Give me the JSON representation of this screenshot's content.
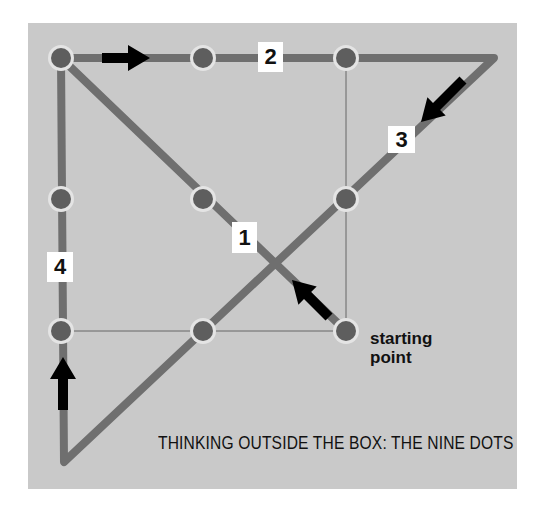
{
  "title": "THINKING OUTSIDE THE BOX: THE NINE DOTS",
  "start_label": [
    "starting",
    "point"
  ],
  "step_labels": [
    {
      "text": "1",
      "x": 232,
      "y": 222,
      "w": 25,
      "h": 31
    },
    {
      "text": "2",
      "x": 258,
      "y": 42,
      "w": 25,
      "h": 30
    },
    {
      "text": "3",
      "x": 388,
      "y": 126,
      "w": 27,
      "h": 27
    },
    {
      "text": "4",
      "x": 47,
      "y": 252,
      "w": 26,
      "h": 30
    }
  ],
  "colors": {
    "background": "#c9c9c9",
    "path_line": "#6f6f6f",
    "dot": "#5e5e5e",
    "dot_halo": "#e4e4e4",
    "box_outline": "#666666",
    "arrow": "#000000"
  },
  "grid": {
    "xs": [
      61,
      203,
      346
    ],
    "ys": [
      58,
      199,
      331
    ]
  },
  "path_points": [
    [
      346,
      331
    ],
    [
      61,
      58
    ],
    [
      494,
      58
    ],
    [
      64,
      462
    ],
    [
      61,
      58
    ]
  ],
  "arrows": [
    {
      "name": "arrow-step-1",
      "from": [
        329,
        317
      ],
      "to": [
        292,
        280
      ]
    },
    {
      "name": "arrow-step-2",
      "from": [
        102,
        58
      ],
      "to": [
        150,
        58
      ]
    },
    {
      "name": "arrow-step-3",
      "from": [
        463,
        80
      ],
      "to": [
        421,
        122
      ]
    },
    {
      "name": "arrow-step-4",
      "from": [
        63,
        410
      ],
      "to": [
        63,
        357
      ]
    }
  ]
}
